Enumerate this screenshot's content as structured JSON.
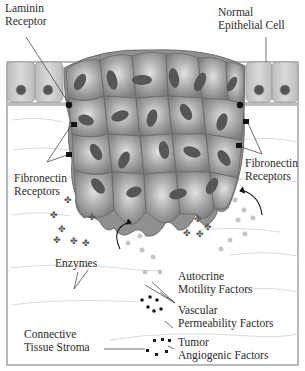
{
  "diagram": {
    "labels": {
      "laminin_receptor": [
        "Laminin",
        "Receptor"
      ],
      "normal_epithelial_cell": [
        "Normal",
        "Epithelial Cell"
      ],
      "fibronectin_receptors_left": [
        "Fibronectin",
        "Receptors"
      ],
      "fibronectin_receptors_right": [
        "Fibronectin",
        "Receptors"
      ],
      "enzymes": "Enzymes",
      "autocrine_motility_factors": [
        "Autocrine",
        "Motility Factors"
      ],
      "vascular_permeability_factors": [
        "Vascular",
        "Permeability Factors"
      ],
      "connective_tissue_stroma": [
        "Connective",
        "Tissue Stroma"
      ],
      "tumor_angiogenic_factors": [
        "Tumor",
        "Angiogenic Factors"
      ]
    },
    "colors": {
      "tumor_cell": "#8f8f8f",
      "tumor_cell_highlight": "#d6d6d6",
      "nucleus": "#555555",
      "epithelial_cell": "#cfcfcf",
      "basement_membrane": "#bdbdbd",
      "receptor": "#111111",
      "stroma_fiber": "#d8d8d8",
      "frame": "#888888",
      "text": "#2b2b2b"
    }
  }
}
